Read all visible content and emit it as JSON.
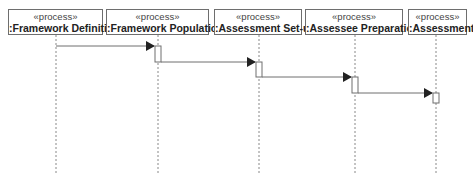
{
  "diagram": {
    "type": "uml-sequence",
    "participants": [
      {
        "stereotype": "«process»",
        "name": ":Framework Definition",
        "box": [
          8,
          103
        ],
        "lifeline_x": 56
      },
      {
        "stereotype": "«process»",
        "name": ":Framework Population",
        "box": [
          106,
          209
        ],
        "lifeline_x": 158
      },
      {
        "stereotype": "«process»",
        "name": ":Assessment Set-up",
        "box": [
          214,
          302
        ],
        "lifeline_x": 259
      },
      {
        "stereotype": "«process»",
        "name": ":Assessee Preparation",
        "box": [
          305,
          403
        ],
        "lifeline_x": 355
      },
      {
        "stereotype": "«process»",
        "name": ":Assessment",
        "box": [
          408,
          467
        ],
        "lifeline_x": 436
      }
    ],
    "messages": [
      {
        "from": 0,
        "to": 1,
        "y": 46
      },
      {
        "from": 1,
        "to": 2,
        "y": 62
      },
      {
        "from": 2,
        "to": 3,
        "y": 77
      },
      {
        "from": 3,
        "to": 4,
        "y": 93
      }
    ],
    "activations": [
      {
        "participant": 1,
        "y1": 46,
        "y2": 62
      },
      {
        "participant": 2,
        "y1": 62,
        "y2": 77
      },
      {
        "participant": 3,
        "y1": 77,
        "y2": 93
      },
      {
        "participant": 4,
        "y1": 93,
        "y2": 103
      }
    ],
    "lifeline_end_y": 173,
    "colors": {
      "line": "#6e6e6e",
      "arrowhead": "#222222",
      "lifeline": "#888888"
    }
  }
}
